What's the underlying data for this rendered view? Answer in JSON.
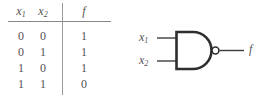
{
  "figure": {
    "background_color": "#ffffff",
    "ink_color": "#3a3a3a",
    "text_color": "#555152"
  },
  "truth_table": {
    "headers": [
      "x",
      "x",
      "f"
    ],
    "header_labels": {
      "col1_base": "x",
      "col1_sub": "1",
      "col2_base": "x",
      "col2_sub": "2",
      "col3": "f"
    },
    "rows": [
      {
        "x1": "0",
        "x2": "0",
        "f": "1"
      },
      {
        "x1": "0",
        "x2": "1",
        "f": "1"
      },
      {
        "x1": "1",
        "x2": "0",
        "f": "1"
      },
      {
        "x1": "1",
        "x2": "1",
        "f": "0"
      }
    ]
  },
  "circuit": {
    "gate_type": "nand-gate",
    "inputs": [
      {
        "base": "x",
        "sub": "1"
      },
      {
        "base": "x",
        "sub": "2"
      }
    ],
    "output": {
      "label": "f"
    },
    "has_inversion_bubble": true
  }
}
